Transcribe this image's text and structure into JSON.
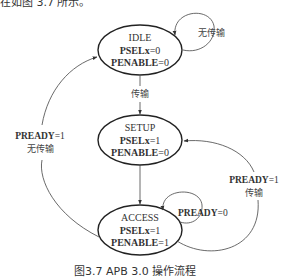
{
  "top_text": "在如图 3.7 所示。",
  "caption": "图3.7  APB 3.0 操作流程",
  "states": [
    {
      "id": "idle",
      "name": "IDLE",
      "signals": [
        {
          "name": "PSELx",
          "value": "=0"
        },
        {
          "name": "PENABLE",
          "value": "=0"
        }
      ]
    },
    {
      "id": "setup",
      "name": "SETUP",
      "signals": [
        {
          "name": "PSELx",
          "value": "=1"
        },
        {
          "name": "PENABLE",
          "value": "=0"
        }
      ]
    },
    {
      "id": "access",
      "name": "ACCESS",
      "signals": [
        {
          "name": "PSELx",
          "value": "=1"
        },
        {
          "name": "PENABLE",
          "value": "=1"
        }
      ]
    }
  ],
  "transitions": {
    "idle_self": {
      "label": "无传输"
    },
    "idle_to_setup": {
      "label": "传输"
    },
    "access_to_idle": {
      "cond_name": "PREADY",
      "cond_value": "=1",
      "label": "无传输"
    },
    "access_to_setup": {
      "cond_name": "PREADY",
      "cond_value": "=1",
      "label": "传输"
    },
    "access_self": {
      "cond_name": "PREADY",
      "cond_value": "=0"
    }
  }
}
